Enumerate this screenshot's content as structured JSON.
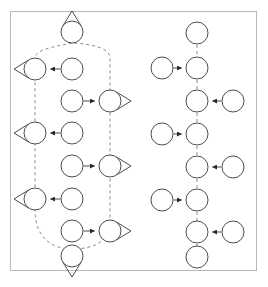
{
  "figure": {
    "title": "",
    "background_color": "#ffffff",
    "width": 268,
    "height": 287,
    "frame": {
      "x": 10,
      "y": 11,
      "width": 246,
      "height": 259,
      "stroke": "#b9b9b9",
      "stroke_width": 1,
      "fill": "#ffffff"
    }
  },
  "style": {
    "node_stroke": "#4d4d4d",
    "node_fill": "#ffffff",
    "node_stroke_width": 1,
    "node_radius": 11,
    "edge_solid_stroke": "#4d4d4d",
    "edge_solid_width": 1,
    "edge_dashed_stroke": "#8a8a8a",
    "edge_dashed_width": 1,
    "edge_dash_pattern": "3,3",
    "arrow_fill": "#2b2b2b",
    "selfloop_stroke": "#4d4d4d",
    "selfloop_width": 1
  },
  "graph": {
    "description": "Two disconnected directed graph components drawn side by side inside a light grey rectangular frame",
    "node_count": 26,
    "components": [
      {
        "name": "left-component",
        "node_count": 15,
        "has_dashed_cycle": true,
        "dashed_cycle_description": "closed dashed loop threading the leftmost column upward and the inner column downward, wrapping around the top node and the bottom node"
      },
      {
        "name": "right-component",
        "node_count": 11,
        "has_dashed_cycle": false,
        "dashed_cycle_description": "single dashed vertical spine connecting the central chain of nodes"
      }
    ],
    "nodes": [
      {
        "id": "L-top",
        "cx": 72,
        "cy": 32,
        "label": "",
        "self_loop": "up",
        "component": "left-component"
      },
      {
        "id": "L-a1",
        "cx": 35,
        "cy": 69,
        "label": "",
        "self_loop": "left",
        "component": "left-component"
      },
      {
        "id": "L-a2",
        "cx": 72,
        "cy": 69,
        "label": "",
        "self_loop": "none",
        "component": "left-component"
      },
      {
        "id": "L-b1",
        "cx": 72,
        "cy": 101,
        "label": "",
        "self_loop": "none",
        "component": "left-component"
      },
      {
        "id": "L-b2",
        "cx": 110,
        "cy": 101,
        "label": "",
        "self_loop": "right",
        "component": "left-component"
      },
      {
        "id": "L-c1",
        "cx": 35,
        "cy": 133,
        "label": "",
        "self_loop": "left",
        "component": "left-component"
      },
      {
        "id": "L-c2",
        "cx": 72,
        "cy": 133,
        "label": "",
        "self_loop": "none",
        "component": "left-component"
      },
      {
        "id": "L-d1",
        "cx": 72,
        "cy": 166,
        "label": "",
        "self_loop": "none",
        "component": "left-component"
      },
      {
        "id": "L-d2",
        "cx": 110,
        "cy": 166,
        "label": "",
        "self_loop": "right",
        "component": "left-component"
      },
      {
        "id": "L-e1",
        "cx": 35,
        "cy": 199,
        "label": "",
        "self_loop": "left",
        "component": "left-component"
      },
      {
        "id": "L-e2",
        "cx": 72,
        "cy": 199,
        "label": "",
        "self_loop": "none",
        "component": "left-component"
      },
      {
        "id": "L-f1",
        "cx": 72,
        "cy": 231,
        "label": "",
        "self_loop": "none",
        "component": "left-component"
      },
      {
        "id": "L-f2",
        "cx": 110,
        "cy": 231,
        "label": "",
        "self_loop": "right",
        "component": "left-component"
      },
      {
        "id": "L-bot",
        "cx": 72,
        "cy": 256,
        "label": "",
        "self_loop": "down",
        "component": "left-component"
      },
      {
        "id": "R-top",
        "cx": 197,
        "cy": 33,
        "label": "",
        "self_loop": "none",
        "component": "right-component"
      },
      {
        "id": "R-s1",
        "cx": 162,
        "cy": 68,
        "label": "",
        "self_loop": "none",
        "component": "right-component"
      },
      {
        "id": "R-m1",
        "cx": 197,
        "cy": 68,
        "label": "",
        "self_loop": "none",
        "component": "right-component"
      },
      {
        "id": "R-m2",
        "cx": 197,
        "cy": 101,
        "label": "",
        "self_loop": "none",
        "component": "right-component"
      },
      {
        "id": "R-s2",
        "cx": 233,
        "cy": 101,
        "label": "",
        "self_loop": "none",
        "component": "right-component"
      },
      {
        "id": "R-s3",
        "cx": 162,
        "cy": 134,
        "label": "",
        "self_loop": "none",
        "component": "right-component"
      },
      {
        "id": "R-m3",
        "cx": 197,
        "cy": 134,
        "label": "",
        "self_loop": "none",
        "component": "right-component"
      },
      {
        "id": "R-m4",
        "cx": 197,
        "cy": 167,
        "label": "",
        "self_loop": "none",
        "component": "right-component"
      },
      {
        "id": "R-s4",
        "cx": 233,
        "cy": 167,
        "label": "",
        "self_loop": "none",
        "component": "right-component"
      },
      {
        "id": "R-s5",
        "cx": 162,
        "cy": 200,
        "label": "",
        "self_loop": "none",
        "component": "right-component"
      },
      {
        "id": "R-m5",
        "cx": 197,
        "cy": 200,
        "label": "",
        "self_loop": "none",
        "component": "right-component"
      },
      {
        "id": "R-m6",
        "cx": 197,
        "cy": 232,
        "label": "",
        "self_loop": "none",
        "component": "right-component"
      },
      {
        "id": "R-s6",
        "cx": 233,
        "cy": 232,
        "label": "",
        "self_loop": "none",
        "component": "right-component"
      },
      {
        "id": "R-bot",
        "cx": 197,
        "cy": 257,
        "label": "",
        "self_loop": "none",
        "component": "right-component"
      }
    ],
    "solid_edges": [
      {
        "from": "L-a2",
        "to": "L-a1",
        "direction": "left"
      },
      {
        "from": "L-b1",
        "to": "L-b2",
        "direction": "right"
      },
      {
        "from": "L-c2",
        "to": "L-c1",
        "direction": "left"
      },
      {
        "from": "L-d1",
        "to": "L-d2",
        "direction": "right"
      },
      {
        "from": "L-e2",
        "to": "L-e1",
        "direction": "left"
      },
      {
        "from": "L-f1",
        "to": "L-f2",
        "direction": "right"
      },
      {
        "from": "R-s1",
        "to": "R-m1",
        "direction": "right"
      },
      {
        "from": "R-s2",
        "to": "R-m2",
        "direction": "left"
      },
      {
        "from": "R-s3",
        "to": "R-m3",
        "direction": "right"
      },
      {
        "from": "R-s4",
        "to": "R-m4",
        "direction": "left"
      },
      {
        "from": "R-s5",
        "to": "R-m5",
        "direction": "right"
      },
      {
        "from": "R-s6",
        "to": "R-m6",
        "direction": "left"
      }
    ],
    "dashed_edges": [
      {
        "from": "R-top",
        "to": "R-m1"
      },
      {
        "from": "R-m1",
        "to": "R-m2"
      },
      {
        "from": "R-m2",
        "to": "R-m3"
      },
      {
        "from": "R-m3",
        "to": "R-m4"
      },
      {
        "from": "R-m4",
        "to": "R-m5"
      },
      {
        "from": "R-m5",
        "to": "R-m6"
      },
      {
        "from": "R-m6",
        "to": "R-bot"
      }
    ],
    "dashed_cycle_path": "M 72 43 C 52 47 35 50 35 58 L 35 80 L 35 122 L 35 144 L 35 188 L 35 210 C 35 238 52 249 72 249 C 96 249 110 240 110 222 L 110 210 L 110 177 L 110 155 L 110 112 L 110 90 L 110 58 C 110 48 92 44 72 43 Z"
  }
}
